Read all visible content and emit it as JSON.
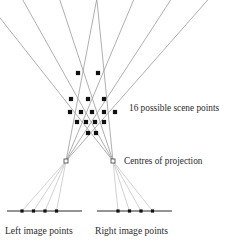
{
  "figure": {
    "background_color": "#ffffff",
    "width": 234,
    "height": 247,
    "labels": {
      "scene_points": "16 possible scene points",
      "centres_of_projection": "Centres of projection",
      "left_image_points": "Left image points",
      "right_image_points": "Right image points"
    },
    "colors": {
      "scene_point": "#111111",
      "image_point": "#111111",
      "camera_centre_stroke": "#555555",
      "camera_centre_fill": "#ffffff",
      "scene_ray": "#8a8a8a",
      "projection_ray": "#c9c9c9",
      "image_line": "#2a2a2a",
      "text": "#2b2b2b"
    },
    "counts": {
      "scene_points": 16,
      "left_image_points": 4,
      "right_image_points": 4,
      "centres_of_projection": 2
    },
    "camera_centres": [
      {
        "name": "left-centre-of-projection",
        "x": 66,
        "y": 161
      },
      {
        "name": "right-centre-of-projection",
        "x": 113,
        "y": 161
      }
    ],
    "image_lines": [
      {
        "name": "left-image-line",
        "x1": 7,
        "x2": 82,
        "y": 211
      },
      {
        "name": "right-image-line",
        "x1": 97,
        "x2": 172,
        "y": 211
      }
    ],
    "left_image_points": [
      {
        "x": 22,
        "y": 211
      },
      {
        "x": 33.5,
        "y": 211
      },
      {
        "x": 45,
        "y": 211
      },
      {
        "x": 56.5,
        "y": 211
      }
    ],
    "right_image_points": [
      {
        "x": 118,
        "y": 211
      },
      {
        "x": 129.5,
        "y": 211
      },
      {
        "x": 141,
        "y": 211
      },
      {
        "x": 152.5,
        "y": 211
      }
    ],
    "scene_points": [
      {
        "row": 1,
        "x": 78,
        "y": 73
      },
      {
        "row": 1,
        "x": 98,
        "y": 73
      },
      {
        "row": 2,
        "x": 71,
        "y": 99
      },
      {
        "row": 2,
        "x": 88,
        "y": 99
      },
      {
        "row": 2,
        "x": 104,
        "y": 99
      },
      {
        "row": 3,
        "x": 70,
        "y": 112
      },
      {
        "row": 3,
        "x": 81,
        "y": 112
      },
      {
        "row": 3,
        "x": 92,
        "y": 112
      },
      {
        "row": 3,
        "x": 104,
        "y": 112
      },
      {
        "row": 3,
        "x": 115,
        "y": 112
      },
      {
        "row": 4,
        "x": 77,
        "y": 122
      },
      {
        "row": 4,
        "x": 86,
        "y": 122
      },
      {
        "row": 4,
        "x": 95,
        "y": 122
      },
      {
        "row": 4,
        "x": 104,
        "y": 122
      },
      {
        "row": 5,
        "x": 88,
        "y": 133
      },
      {
        "row": 5,
        "x": 96,
        "y": 133
      }
    ],
    "label_positions": {
      "scene_points": {
        "x": 129,
        "y": 111
      },
      "centres": {
        "x": 124,
        "y": 164
      },
      "left_image": {
        "x": 5,
        "y": 234
      },
      "right_image": {
        "x": 95,
        "y": 234
      }
    }
  }
}
